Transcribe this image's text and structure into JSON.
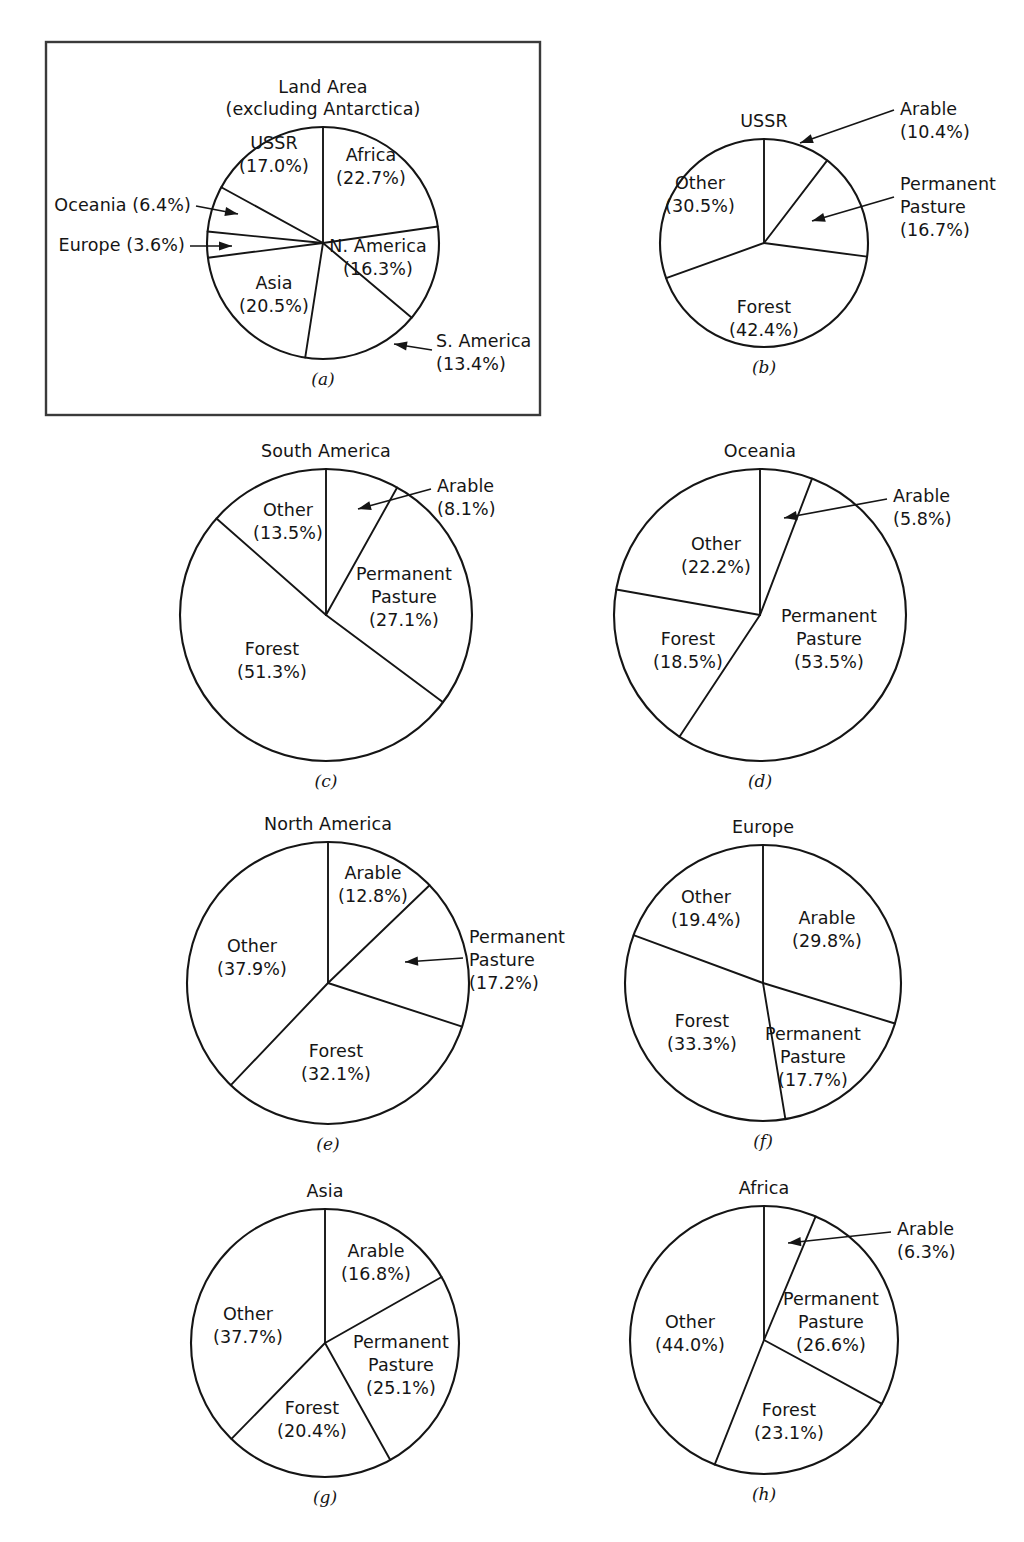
{
  "figure": {
    "background_color": "#ffffff",
    "line_color": "#151515",
    "panel_border_color": "#3a3a3a"
  },
  "chart_data": [
    {
      "id": "a",
      "type": "pie",
      "title": "Land Area",
      "subtitle": "(excluding Antarctica)",
      "caption": "(a)",
      "boxed": true,
      "center": [
        323,
        243
      ],
      "radius": 116,
      "start_angle_deg": 0,
      "direction": "clockwise",
      "categories": [
        "Africa",
        "S. America",
        "N. America",
        "Asia",
        "Europe",
        "Oceania",
        "USSR"
      ],
      "values": [
        22.7,
        13.4,
        16.3,
        20.5,
        3.6,
        6.4,
        17.0
      ],
      "labels": [
        {
          "name": "Africa",
          "value": 22.7,
          "text": "Africa",
          "value_text": "(22.7%)",
          "placement": "inside",
          "pos": [
            371,
            161
          ]
        },
        {
          "name": "S. America",
          "value": 13.4,
          "text": "S. America",
          "value_text": "(13.4%)",
          "placement": "callout",
          "pos": [
            436,
            347
          ],
          "anchor": "start",
          "arrow_from": [
            432,
            350
          ],
          "arrow_to": [
            394,
            344
          ]
        },
        {
          "name": "N. America",
          "value": 16.3,
          "text": "N. America",
          "value_text": "(16.3%)",
          "placement": "inside",
          "pos": [
            378,
            252
          ]
        },
        {
          "name": "Asia",
          "value": 20.5,
          "text": "Asia",
          "value_text": "(20.5%)",
          "placement": "inside",
          "pos": [
            274,
            289
          ]
        },
        {
          "name": "Europe",
          "value": 3.6,
          "text": "Europe (3.6%)",
          "value_text": "",
          "placement": "callout",
          "pos": [
            185,
            251
          ],
          "anchor": "end",
          "arrow_from": [
            190,
            246
          ],
          "arrow_to": [
            232,
            246
          ]
        },
        {
          "name": "Oceania",
          "value": 6.4,
          "text": "Oceania (6.4%)",
          "value_text": "",
          "placement": "callout",
          "pos": [
            191,
            211
          ],
          "anchor": "end",
          "arrow_from": [
            196,
            206
          ],
          "arrow_to": [
            238,
            214
          ]
        },
        {
          "name": "USSR",
          "value": 17.0,
          "text": "USSR",
          "value_text": "(17.0%)",
          "placement": "inside",
          "pos": [
            274,
            149
          ]
        }
      ],
      "box": {
        "x": 46,
        "y": 42,
        "width": 494,
        "height": 373
      }
    },
    {
      "id": "b",
      "type": "pie",
      "title": "USSR",
      "subtitle": "",
      "caption": "(b)",
      "boxed": false,
      "center": [
        764,
        243
      ],
      "radius": 104,
      "start_angle_deg": 0,
      "direction": "clockwise",
      "categories": [
        "Arable",
        "Permanent Pasture",
        "Forest",
        "Other"
      ],
      "values": [
        10.4,
        16.7,
        42.4,
        30.5
      ],
      "labels": [
        {
          "name": "Arable",
          "value": 10.4,
          "text": "Arable",
          "value_text": "(10.4%)",
          "placement": "callout",
          "pos": [
            900,
            115
          ],
          "anchor": "start",
          "arrow_from": [
            894,
            110
          ],
          "arrow_to": [
            800,
            143
          ]
        },
        {
          "name": "Permanent Pasture",
          "value": 16.7,
          "text": "Permanent",
          "value_text": "Pasture",
          "value_text2": "(16.7%)",
          "placement": "callout",
          "pos": [
            900,
            190
          ],
          "anchor": "start",
          "arrow_from": [
            894,
            197
          ],
          "arrow_to": [
            812,
            221
          ]
        },
        {
          "name": "Forest",
          "value": 42.4,
          "text": "Forest",
          "value_text": "(42.4%)",
          "placement": "inside",
          "pos": [
            764,
            313
          ]
        },
        {
          "name": "Other",
          "value": 30.5,
          "text": "Other",
          "value_text": "(30.5%)",
          "placement": "inside",
          "pos": [
            700,
            189
          ]
        }
      ],
      "box": null
    },
    {
      "id": "c",
      "type": "pie",
      "title": "South America",
      "subtitle": "",
      "caption": "(c)",
      "boxed": false,
      "center": [
        326,
        615
      ],
      "radius": 146,
      "start_angle_deg": 0,
      "direction": "clockwise",
      "categories": [
        "Arable",
        "Permanent Pasture",
        "Forest",
        "Other"
      ],
      "values": [
        8.1,
        27.1,
        51.3,
        13.5
      ],
      "labels": [
        {
          "name": "Arable",
          "value": 8.1,
          "text": "Arable",
          "value_text": "(8.1%)",
          "placement": "callout",
          "pos": [
            437,
            492
          ],
          "anchor": "start",
          "arrow_from": [
            431,
            489
          ],
          "arrow_to": [
            358,
            509
          ]
        },
        {
          "name": "Permanent Pasture",
          "value": 27.1,
          "text": "Permanent",
          "value_text": "Pasture",
          "value_text2": "(27.1%)",
          "placement": "inside",
          "pos": [
            404,
            580
          ]
        },
        {
          "name": "Forest",
          "value": 51.3,
          "text": "Forest",
          "value_text": "(51.3%)",
          "placement": "inside",
          "pos": [
            272,
            655
          ]
        },
        {
          "name": "Other",
          "value": 13.5,
          "text": "Other",
          "value_text": "(13.5%)",
          "placement": "inside",
          "pos": [
            288,
            516
          ]
        }
      ],
      "box": null
    },
    {
      "id": "d",
      "type": "pie",
      "title": "Oceania",
      "subtitle": "",
      "caption": "(d)",
      "boxed": false,
      "center": [
        760,
        615
      ],
      "radius": 146,
      "start_angle_deg": 0,
      "direction": "clockwise",
      "categories": [
        "Arable",
        "Permanent Pasture",
        "Forest",
        "Other"
      ],
      "values": [
        5.8,
        53.5,
        18.5,
        22.2
      ],
      "labels": [
        {
          "name": "Arable",
          "value": 5.8,
          "text": "Arable",
          "value_text": "(5.8%)",
          "placement": "callout",
          "pos": [
            893,
            502
          ],
          "anchor": "start",
          "arrow_from": [
            887,
            499
          ],
          "arrow_to": [
            784,
            518
          ]
        },
        {
          "name": "Permanent Pasture",
          "value": 53.5,
          "text": "Permanent",
          "value_text": "Pasture",
          "value_text2": "(53.5%)",
          "placement": "inside",
          "pos": [
            829,
            622
          ]
        },
        {
          "name": "Forest",
          "value": 18.5,
          "text": "Forest",
          "value_text": "(18.5%)",
          "placement": "inside",
          "pos": [
            688,
            645
          ]
        },
        {
          "name": "Other",
          "value": 22.2,
          "text": "Other",
          "value_text": "(22.2%)",
          "placement": "inside",
          "pos": [
            716,
            550
          ]
        }
      ],
      "box": null
    },
    {
      "id": "e",
      "type": "pie",
      "title": "North America",
      "subtitle": "",
      "caption": "(e)",
      "boxed": false,
      "center": [
        328,
        983
      ],
      "radius": 141,
      "start_angle_deg": 0,
      "direction": "clockwise",
      "categories": [
        "Arable",
        "Permanent Pasture",
        "Forest",
        "Other"
      ],
      "values": [
        12.8,
        17.2,
        32.1,
        37.9
      ],
      "labels": [
        {
          "name": "Arable",
          "value": 12.8,
          "text": "Arable",
          "value_text": "(12.8%)",
          "placement": "inside",
          "pos": [
            373,
            879
          ]
        },
        {
          "name": "Permanent Pasture",
          "value": 17.2,
          "text": "Permanent",
          "value_text": "Pasture",
          "value_text2": "(17.2%)",
          "placement": "callout",
          "pos": [
            469,
            943
          ],
          "anchor": "start",
          "arrow_from": [
            463,
            958
          ],
          "arrow_to": [
            405,
            962
          ]
        },
        {
          "name": "Forest",
          "value": 32.1,
          "text": "Forest",
          "value_text": "(32.1%)",
          "placement": "inside",
          "pos": [
            336,
            1057
          ]
        },
        {
          "name": "Other",
          "value": 37.9,
          "text": "Other",
          "value_text": "(37.9%)",
          "placement": "inside",
          "pos": [
            252,
            952
          ]
        }
      ],
      "box": null
    },
    {
      "id": "f",
      "type": "pie",
      "title": "Europe",
      "subtitle": "",
      "caption": "(f)",
      "boxed": false,
      "center": [
        763,
        983
      ],
      "radius": 138,
      "start_angle_deg": 0,
      "direction": "clockwise",
      "categories": [
        "Arable",
        "Permanent Pasture",
        "Forest",
        "Other"
      ],
      "values": [
        29.8,
        17.7,
        33.3,
        19.4
      ],
      "labels": [
        {
          "name": "Arable",
          "value": 29.8,
          "text": "Arable",
          "value_text": "(29.8%)",
          "placement": "inside",
          "pos": [
            827,
            924
          ]
        },
        {
          "name": "Permanent Pasture",
          "value": 17.7,
          "text": "Permanent",
          "value_text": "Pasture",
          "value_text2": "(17.7%)",
          "placement": "inside",
          "pos": [
            813,
            1040
          ]
        },
        {
          "name": "Forest",
          "value": 33.3,
          "text": "Forest",
          "value_text": "(33.3%)",
          "placement": "inside",
          "pos": [
            702,
            1027
          ]
        },
        {
          "name": "Other",
          "value": 19.4,
          "text": "Other",
          "value_text": "(19.4%)",
          "placement": "inside",
          "pos": [
            706,
            903
          ]
        }
      ],
      "box": null
    },
    {
      "id": "g",
      "type": "pie",
      "title": "Asia",
      "subtitle": "",
      "caption": "(g)",
      "boxed": false,
      "center": [
        325,
        1343
      ],
      "radius": 134,
      "start_angle_deg": 0,
      "direction": "clockwise",
      "categories": [
        "Arable",
        "Permanent Pasture",
        "Forest",
        "Other"
      ],
      "values": [
        16.8,
        25.1,
        20.4,
        37.7
      ],
      "labels": [
        {
          "name": "Arable",
          "value": 16.8,
          "text": "Arable",
          "value_text": "(16.8%)",
          "placement": "inside",
          "pos": [
            376,
            1257
          ]
        },
        {
          "name": "Permanent Pasture",
          "value": 25.1,
          "text": "Permanent",
          "value_text": "Pasture",
          "value_text2": "(25.1%)",
          "placement": "inside",
          "pos": [
            401,
            1348
          ]
        },
        {
          "name": "Forest",
          "value": 20.4,
          "text": "Forest",
          "value_text": "(20.4%)",
          "placement": "inside",
          "pos": [
            312,
            1414
          ]
        },
        {
          "name": "Other",
          "value": 37.7,
          "text": "Other",
          "value_text": "(37.7%)",
          "placement": "inside",
          "pos": [
            248,
            1320
          ]
        }
      ],
      "box": null
    },
    {
      "id": "h",
      "type": "pie",
      "title": "Africa",
      "subtitle": "",
      "caption": "(h)",
      "boxed": false,
      "center": [
        764,
        1340
      ],
      "radius": 134,
      "start_angle_deg": 0,
      "direction": "clockwise",
      "categories": [
        "Arable",
        "Permanent Pasture",
        "Forest",
        "Other"
      ],
      "values": [
        6.3,
        26.6,
        23.1,
        44.0
      ],
      "labels": [
        {
          "name": "Arable",
          "value": 6.3,
          "text": "Arable",
          "value_text": "(6.3%)",
          "placement": "callout",
          "pos": [
            897,
            1235
          ],
          "anchor": "start",
          "arrow_from": [
            891,
            1232
          ],
          "arrow_to": [
            788,
            1243
          ]
        },
        {
          "name": "Permanent Pasture",
          "value": 26.6,
          "text": "Permanent",
          "value_text": "Pasture",
          "value_text2": "(26.6%)",
          "placement": "inside",
          "pos": [
            831,
            1305
          ]
        },
        {
          "name": "Forest",
          "value": 23.1,
          "text": "Forest",
          "value_text": "(23.1%)",
          "placement": "inside",
          "pos": [
            789,
            1416
          ]
        },
        {
          "name": "Other",
          "value": 44.0,
          "text": "Other",
          "value_text": "(44.0%)",
          "placement": "inside",
          "pos": [
            690,
            1328
          ]
        }
      ],
      "box": null
    }
  ]
}
